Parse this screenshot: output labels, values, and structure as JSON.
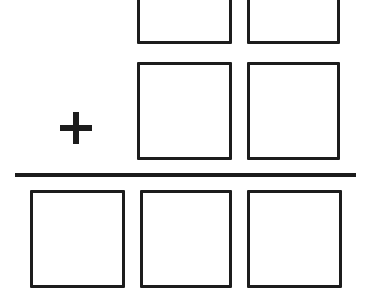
{
  "worksheet": {
    "type": "vertical-addition-problem",
    "operator_symbol": "+",
    "background_color": "#ffffff",
    "ink_color": "#1c1c1c",
    "rows": [
      {
        "role": "first-addend",
        "cropped_at_top": true,
        "cells": [
          {
            "position": "tens",
            "value": ""
          },
          {
            "position": "ones",
            "value": ""
          }
        ]
      },
      {
        "role": "second-addend",
        "cropped_at_top": false,
        "cells": [
          {
            "position": "tens",
            "value": ""
          },
          {
            "position": "ones",
            "value": ""
          }
        ]
      },
      {
        "role": "sum",
        "cropped_at_top": false,
        "cells": [
          {
            "position": "hundreds",
            "value": ""
          },
          {
            "position": "tens",
            "value": ""
          },
          {
            "position": "ones",
            "value": ""
          }
        ]
      }
    ]
  }
}
